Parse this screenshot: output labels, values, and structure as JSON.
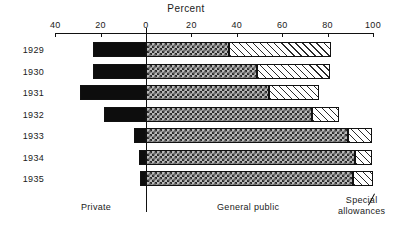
{
  "chart_data": {
    "type": "bar",
    "orientation": "horizontal",
    "stacked": true,
    "diverging": true,
    "title": "",
    "xlabel": "Percent",
    "ylabel": "",
    "axis_title": "Percent",
    "categories": [
      "1929",
      "1930",
      "1931",
      "1932",
      "1933",
      "1934",
      "1935"
    ],
    "xlim": [
      -40,
      100
    ],
    "xticks": [
      -40,
      -20,
      0,
      20,
      40,
      60,
      80,
      100
    ],
    "xticklabels": [
      "40",
      "20",
      "0",
      "20",
      "40",
      "60",
      "80",
      "100"
    ],
    "grid": false,
    "legend_position": "below-axis",
    "series": [
      {
        "name": "Private",
        "direction": "left",
        "values": [
          23.5,
          23.5,
          29.0,
          18.5,
          5.5,
          3.0,
          2.5
        ]
      },
      {
        "name": "General public",
        "direction": "right",
        "values": [
          36.5,
          49.0,
          54.0,
          73.0,
          89.0,
          92.0,
          91.0
        ]
      },
      {
        "name": "Special allowances",
        "direction": "right",
        "values": [
          45.0,
          32.0,
          22.0,
          12.0,
          10.5,
          7.5,
          9.0
        ]
      }
    ],
    "group_labels": [
      "Private",
      "General public",
      "Special / allowances"
    ]
  },
  "labels": {
    "axis_title": "Percent",
    "ticks": [
      "40",
      "20",
      "0",
      "20",
      "40",
      "60",
      "80",
      "100"
    ],
    "years": [
      "1929",
      "1930",
      "1931",
      "1932",
      "1933",
      "1934",
      "1935"
    ],
    "private": "Private",
    "general_public": "General public",
    "special_line1": "Special",
    "special_line2": "allowances"
  },
  "colors": {
    "ink": "#111111",
    "private_fill": "#0d0d0d",
    "general_fill": "#b9b9b9",
    "special_fill": "#ffffff",
    "background": "#ffffff"
  }
}
